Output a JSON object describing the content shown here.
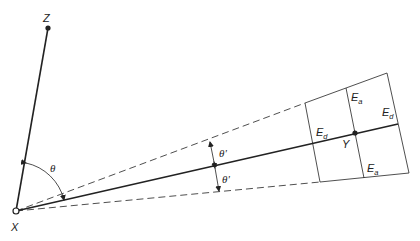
{
  "diagram": {
    "points": {
      "X": {
        "label": "X",
        "kind": "open-circle"
      },
      "Z": {
        "label": "Z",
        "kind": "filled-dot"
      },
      "Y": {
        "label": "Y",
        "kind": "filled-dot"
      }
    },
    "angles": {
      "theta": "θ",
      "theta_prime_upper": "θ'",
      "theta_prime_lower": "θ'"
    },
    "error_labels": {
      "ed_left": {
        "main": "E",
        "sub": "d"
      },
      "ed_right": {
        "main": "E",
        "sub": "d"
      },
      "ea_top": {
        "main": "E",
        "sub": "a"
      },
      "ea_bottom": {
        "main": "E",
        "sub": "a"
      }
    },
    "colors": {
      "line": "#222222",
      "background": "#ffffff"
    }
  }
}
